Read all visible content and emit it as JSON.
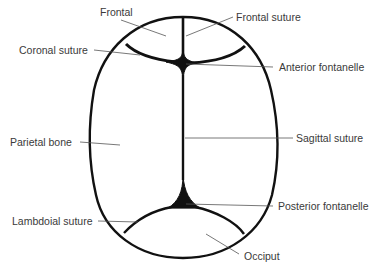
{
  "diagram": {
    "colors": {
      "outline": "#111111",
      "leader_line": "#555555",
      "label_text": "#3a3a3a",
      "background": "#ffffff"
    },
    "labels": [
      {
        "id": "frontal",
        "text": "Frontal"
      },
      {
        "id": "frontal-suture",
        "text": "Frontal suture"
      },
      {
        "id": "coronal-suture",
        "text": "Coronal suture"
      },
      {
        "id": "anterior-fontanelle",
        "text": "Anterior fontanelle"
      },
      {
        "id": "parietal-bone",
        "text": "Parietal bone"
      },
      {
        "id": "sagittal-suture",
        "text": "Sagittal suture"
      },
      {
        "id": "posterior-fontanelle",
        "text": "Posterior fontanelle"
      },
      {
        "id": "lambdoial-suture",
        "text": "Lambdoial suture"
      },
      {
        "id": "occiput",
        "text": "Occiput"
      }
    ]
  }
}
